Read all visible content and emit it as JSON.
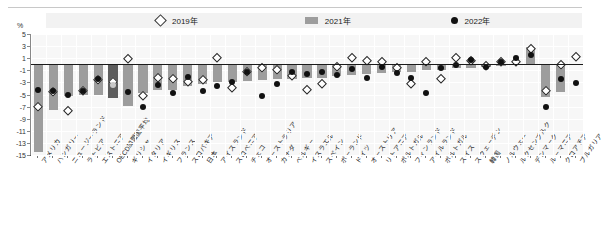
{
  "header": {
    "unit_label": "%"
  },
  "legend": {
    "items": [
      {
        "label": "2019年",
        "marker": "diamond-outline-icon",
        "color": "#ffffff"
      },
      {
        "label": "2021年",
        "marker": "gray-bar-icon",
        "color": "#9d9d9d"
      },
      {
        "label": "2022年",
        "marker": "black-dot-icon",
        "color": "#111111"
      }
    ]
  },
  "chart_data": {
    "type": "bar",
    "title": "",
    "xlabel": "",
    "ylabel": "%",
    "ylim": [
      -15,
      5
    ],
    "yticks": [
      5,
      3,
      1,
      -1,
      -3,
      -5,
      -7,
      -9,
      -11,
      -13,
      -15
    ],
    "grid": true,
    "legend_position": "top",
    "categories": [
      "アメリカ",
      "ハンガリー",
      "ニュージーランド",
      "ラトビア",
      "エストニア",
      "OECD加盟国平均",
      "ギリシャ",
      "イタリア",
      "イギリス",
      "フランス",
      "スロバキア",
      "日本",
      "アイスランド",
      "スロベニア",
      "チェコ",
      "オーストラリア",
      "カナダ",
      "ベルギー",
      "イスラエル",
      "スペイン",
      "ポーランド",
      "ドイツ",
      "オーストリア",
      "リトアニア",
      "ポルトガル",
      "フィンランド",
      "アイルランド",
      "ポルトガル",
      "スイス",
      "スウェーデン",
      "韓国",
      "ノルウェー",
      "ルクセンブルク",
      "デンマーク",
      "ルーマニア",
      "クロアチア",
      "ブルガリア"
    ],
    "series": [
      {
        "name": "2021年",
        "type": "bar",
        "values": [
          -14.5,
          -7.6,
          -5.3,
          -5.1,
          -5.0,
          -5.6,
          -6.9,
          -4.7,
          -4.3,
          -4.2,
          -3.6,
          -3.3,
          -3.0,
          -2.9,
          -2.7,
          -2.6,
          -2.5,
          -2.4,
          -2.3,
          -2.2,
          -2.0,
          -1.8,
          -1.6,
          -1.4,
          -1.3,
          -1.2,
          -1.0,
          -0.9,
          -0.7,
          -0.6,
          -0.4,
          -0.3,
          -0.2,
          2.9,
          -5.4,
          -4.6,
          -0.1
        ]
      },
      {
        "name": "2022年",
        "type": "scatter-dot",
        "values": [
          -4.3,
          -4.5,
          -5.0,
          -4.5,
          -2.4,
          -3.4,
          -4.6,
          -7.0,
          -3.5,
          -4.8,
          -2.1,
          -4.5,
          -3.6,
          -2.9,
          -1.3,
          -5.2,
          -3.2,
          -1.3,
          -1.6,
          -1.2,
          -1.8,
          -0.8,
          -2.2,
          -0.4,
          -1.4,
          -2.2,
          -4.8,
          -0.7,
          -0.2,
          0.7,
          -0.5,
          0.4,
          1.1,
          1.5,
          -7.1,
          -2.5,
          -3.1
        ]
      },
      {
        "name": "2019年",
        "type": "scatter-diamond",
        "values": [
          -7.0,
          -4.6,
          -7.7,
          -4.5,
          -2.6,
          -3.0,
          0.9,
          -5.3,
          -2.2,
          -2.5,
          -3.0,
          -2.6,
          1.0,
          -3.9,
          -1.3,
          -0.6,
          -0.9,
          -2.0,
          -4.2,
          -3.3,
          -0.4,
          1.1,
          0.5,
          0.3,
          -0.7,
          -3.2,
          0.4,
          -2.5,
          1.0,
          0.5,
          -0.3,
          0.4,
          0.3,
          2.6,
          -4.5,
          -0.2,
          1.2
        ]
      }
    ]
  }
}
